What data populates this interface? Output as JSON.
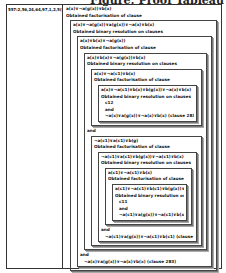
{
  "header": "Figure: Proof Tableau",
  "left_cell": "557:2,56,24,64,97,1,2,5(5)",
  "proof": {
    "l1": "a(x)∨¬a(g(x))∨b(x)",
    "l2": "Obtained factorisation of clause",
    "b1": {
      "l1": "a(x)∨¬a(g(x))∨a(g(x))∨¬a(x)∨b(x)",
      "l2": "Obtained binary resolution on clauses",
      "b2": {
        "l1": "a(x)∨b(x)∨¬a(g(x))",
        "l2": "Obtained factorisation of clause",
        "b3": {
          "l1": "a(x)∨b(x)∨¬a(g(x))∨b(x)",
          "l2": "Obtained binary resolution on clauses",
          "b4": {
            "l1": "a(x)∨¬a(c1)∨b(x)",
            "l2": "Obtained factorisation of clause",
            "b5": {
              "l1": "a(x)∨¬a(c1)∨b(x)∨b(g(x))∨¬a(x)∨b(x)",
              "l2": "Obtained binary resolution on clauses",
              "l3": "c12",
              "l4": "and",
              "l5": "¬a(x)∨a(g(x))∨¬a(x)∨b(x) (clause 283)"
            }
          },
          "and": "and",
          "b6": {
            "l1": "¬a(c1)∨a(c1)∨b(g)",
            "l2": "Obtained factorisation of clause",
            "b7": {
              "l1": "¬a(c1)∨a(c1)∨b(g(x))∨¬a(c1)∨b(x)",
              "l2": "Obtained binary resolution on clauses",
              "b8": {
                "l1": "a(c1)∨¬a(c1)∨b(x)",
                "l2": "Obtained factorisation of clause",
                "b9": {
                  "l1": "a(c1)∨¬a(c1)∨b(c1)∨b(g(x))∨¬a(c1)∨b(x)",
                  "l2": "Obtained binary resolution on clauses",
                  "l3": "c11",
                  "l4": "and",
                  "l5": "¬a(c1)∨a(g(x))∨¬a(c1)∨b(x) (clause 283)"
                }
              },
              "and": "and",
              "l3": "¬a(c1)∨a(g(x))∨¬a(c1)∨b(c1) (clause 283)"
            }
          }
        },
        "and": "and",
        "l3": "¬a(x)∨a(g(x))∨¬a(x)∨b(x) (clause 283)"
      }
    }
  }
}
